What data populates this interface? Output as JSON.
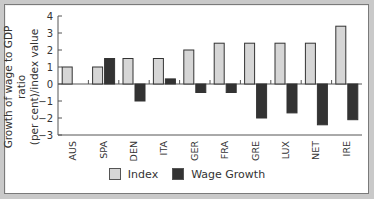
{
  "chart_data": {
    "type": "bar",
    "title": "",
    "xlabel": "",
    "ylabel": "Growth of wage to GDP ratio (per cent)/index value",
    "ylabel_lines": [
      "Growth of wage to GDP ratio",
      "(per cent)/index value"
    ],
    "ylim": [
      -3,
      4
    ],
    "yticks": [
      4,
      3,
      2,
      1,
      0,
      -1,
      -2,
      -3
    ],
    "grid": false,
    "legend_position": "bottom",
    "categories": [
      "AUS",
      "SPA",
      "DEN",
      "ITA",
      "GER",
      "FRA",
      "GRE",
      "LUX",
      "NET",
      "IRE"
    ],
    "series": [
      {
        "name": "Index",
        "color": "#d6d6d6",
        "values": [
          1.0,
          1.0,
          1.5,
          1.5,
          2.0,
          2.4,
          2.4,
          2.4,
          2.4,
          3.4
        ]
      },
      {
        "name": "Wage Growth",
        "color": "#333333",
        "values": [
          null,
          1.5,
          -1.0,
          0.3,
          -0.5,
          -0.5,
          -2.0,
          -1.7,
          -2.4,
          -2.1
        ]
      }
    ]
  },
  "legend": {
    "items": [
      {
        "label": "Index",
        "color": "#d6d6d6"
      },
      {
        "label": "Wage Growth",
        "color": "#333333"
      }
    ]
  },
  "colors": {
    "frame_bg": "#c9c9c9",
    "panel_bg": "#ffffff",
    "axis": "#555555"
  }
}
